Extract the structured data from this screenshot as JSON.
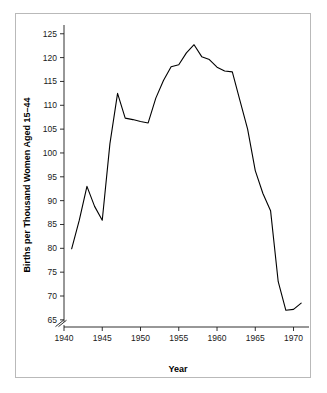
{
  "chart_data": {
    "type": "line",
    "title": "",
    "subtitle": "",
    "xlabel": "Year",
    "ylabel": "Births per Thousand Women Aged 15–44",
    "xlim": [
      1940,
      1971.5
    ],
    "ylim": [
      63.5,
      126
    ],
    "xticks": [
      1940,
      1945,
      1950,
      1955,
      1960,
      1965,
      1970
    ],
    "xtick_labels": [
      "1940",
      "1945",
      "1950",
      "1955",
      "1960",
      "1965",
      "1970"
    ],
    "yticks": [
      65,
      70,
      75,
      80,
      85,
      90,
      95,
      100,
      105,
      110,
      115,
      120,
      125
    ],
    "ytick_labels": [
      "65",
      "70",
      "75",
      "80",
      "85",
      "90",
      "95",
      "100",
      "105",
      "110",
      "115",
      "120",
      "125"
    ],
    "grid": false,
    "legend": null,
    "axis_break": {
      "axis": "y",
      "below_value": 65,
      "symbol": "double-slash"
    },
    "line_color": "#000000",
    "markers": false,
    "series": [
      {
        "name": "Birth rate",
        "x": [
          1941,
          1942,
          1943,
          1944,
          1945,
          1946,
          1947,
          1948,
          1949,
          1950,
          1951,
          1952,
          1953,
          1954,
          1955,
          1956,
          1957,
          1958,
          1959,
          1960,
          1961,
          1962,
          1963,
          1964,
          1965,
          1966,
          1967,
          1968,
          1969,
          1970,
          1971
        ],
        "values": [
          79.9,
          85.9,
          93.0,
          88.8,
          85.9,
          101.9,
          112.5,
          107.3,
          107.0,
          106.6,
          106.3,
          111.5,
          115.2,
          118.1,
          118.5,
          121.0,
          122.7,
          120.2,
          119.6,
          118.0,
          117.2,
          117.0,
          111.0,
          105.0,
          96.3,
          91.5,
          87.9,
          73.0,
          67.0,
          67.2,
          68.5
        ]
      }
    ]
  },
  "figure": {
    "background_color": "#ffffff",
    "frame_color": "#b9b9b9"
  }
}
